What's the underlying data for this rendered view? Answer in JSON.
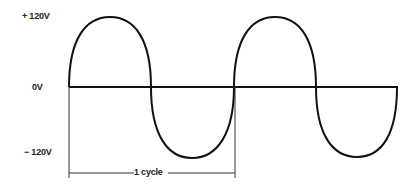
{
  "axis_labels": {
    "positive": "+ 120V",
    "zero": "0V",
    "negative": "− 120V"
  },
  "cycle_label": "1 cycle",
  "colors": {
    "line": "#111111",
    "bracket": "#333333"
  },
  "wave": {
    "type": "sine",
    "amplitude_volts": 120,
    "cycles_shown": 2,
    "start_phase_deg": 0
  }
}
